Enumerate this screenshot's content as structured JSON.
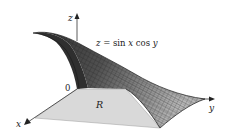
{
  "figure": {
    "equation": {
      "prefix": "z = ",
      "body": "sin x cos y"
    },
    "axes": {
      "x_label": "x",
      "y_label": "y",
      "z_label": "z",
      "origin_label": "0"
    },
    "region_label": "R",
    "colors": {
      "surface_dark": "#3a3a3a",
      "surface_mid": "#7a7a7a",
      "surface_light": "#b5b5b5",
      "region": "#d9d9d9",
      "axis": "#333333",
      "mesh": "#1e1e1e"
    }
  }
}
